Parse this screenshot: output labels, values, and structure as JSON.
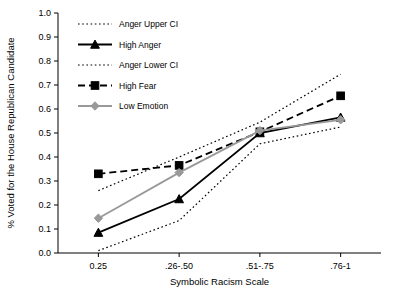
{
  "chart_data": {
    "type": "line",
    "title": "",
    "xlabel": "Symbolic Racism Scale",
    "ylabel": "% Voted for the House Republican Candidate",
    "categories": [
      "0.25",
      ".26-.50",
      ".51-.75",
      ".76-1"
    ],
    "ylim": [
      0.0,
      1.0
    ],
    "ytick_labels": [
      "0.0",
      "0.1",
      "0.2",
      "0.3",
      "0.4",
      "0.5",
      "0.6",
      "0.7",
      "0.8",
      "0.9",
      "1.0"
    ],
    "ytick_values": [
      0.0,
      0.1,
      0.2,
      0.3,
      0.4,
      0.5,
      0.6,
      0.7,
      0.8,
      0.9,
      1.0
    ],
    "grid": false,
    "legend_position": "upper left",
    "series": [
      {
        "name": "Anger Upper CI",
        "values": [
          0.26,
          0.4,
          0.545,
          0.745
        ],
        "style": "dotted",
        "marker": "none",
        "color": "#000000"
      },
      {
        "name": "High Anger",
        "values": [
          0.085,
          0.225,
          0.5,
          0.565
        ],
        "style": "solid",
        "marker": "triangle",
        "color": "#000000"
      },
      {
        "name": "Anger Lower CI",
        "values": [
          0.01,
          0.135,
          0.455,
          0.525
        ],
        "style": "dotted",
        "marker": "none",
        "color": "#000000"
      },
      {
        "name": "High Fear",
        "values": [
          0.33,
          0.365,
          0.505,
          0.655
        ],
        "style": "dashed",
        "marker": "square",
        "color": "#000000"
      },
      {
        "name": "Low Emotion",
        "values": [
          0.145,
          0.335,
          0.51,
          0.555
        ],
        "style": "solid",
        "marker": "diamond",
        "color": "#999999"
      }
    ]
  }
}
